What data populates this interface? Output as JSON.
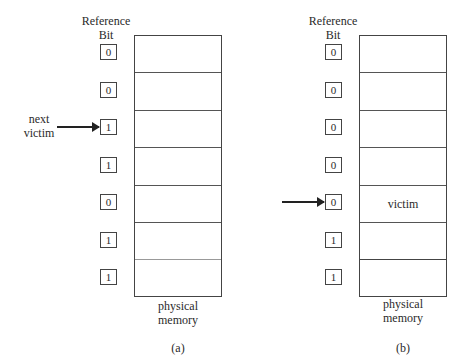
{
  "figure": {
    "panels": [
      {
        "id": "a",
        "caption": "(a)",
        "header_line1": "Reference",
        "header_line2": "Bit",
        "memory_label_line1": "physical",
        "memory_label_line2": "memory",
        "pointer_label_line1": "next",
        "pointer_label_line2": "victim",
        "pointer_row": 2,
        "reference_bits": [
          "0",
          "0",
          "1",
          "1",
          "0",
          "1",
          "1"
        ],
        "frames": [
          "",
          "",
          "",
          "",
          "",
          "",
          ""
        ]
      },
      {
        "id": "b",
        "caption": "(b)",
        "header_line1": "Reference",
        "header_line2": "Bit",
        "memory_label_line1": "physical",
        "memory_label_line2": "memory",
        "pointer_label_line1": "",
        "pointer_label_line2": "",
        "pointer_row": 4,
        "reference_bits": [
          "0",
          "0",
          "0",
          "0",
          "0",
          "1",
          "1"
        ],
        "frames": [
          "",
          "",
          "",
          "",
          "victim",
          "",
          ""
        ]
      }
    ]
  }
}
